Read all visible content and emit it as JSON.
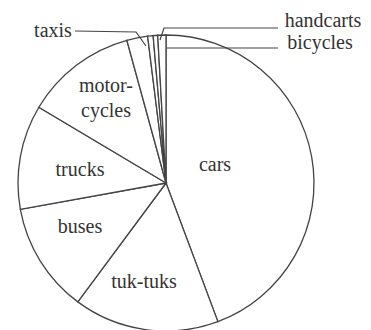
{
  "chart_data": {
    "type": "pie",
    "title": "",
    "start_angle_deg": 0,
    "direction": "clockwise",
    "center": [
      166,
      183
    ],
    "radius": 148,
    "slices": [
      {
        "label": "cars",
        "value": 44.7,
        "label_lines": [
          "cars"
        ],
        "label_pos": [
          215,
          171
        ]
      },
      {
        "label": "tuk-tuks",
        "value": 16.0,
        "label_lines": [
          "tuk-tuks"
        ],
        "label_pos": [
          144,
          288
        ]
      },
      {
        "label": "buses",
        "value": 12.1,
        "label_lines": [
          "buses"
        ],
        "label_pos": [
          80,
          233
        ]
      },
      {
        "label": "trucks",
        "value": 11.5,
        "label_lines": [
          "trucks"
        ],
        "label_pos": [
          80,
          176
        ]
      },
      {
        "label": "motorcycles",
        "value": 12.3,
        "label_lines": [
          "motor-",
          "cycles"
        ],
        "label_pos": [
          106,
          92
        ]
      },
      {
        "label": "taxis",
        "value": 2.3,
        "label_lines": [
          "taxis"
        ],
        "label_pos": [
          53,
          37
        ],
        "external": true
      },
      {
        "label": "",
        "value": 0.6,
        "label_lines": [],
        "label_pos": null
      },
      {
        "label": "handcarts",
        "value": 0.5,
        "label_lines": [
          "handcarts"
        ],
        "label_pos": [
          323,
          27
        ],
        "external": true
      },
      {
        "label": "bicycles",
        "value": 0.9,
        "label_lines": [
          "bicycles"
        ],
        "label_pos": [
          320,
          49
        ],
        "external": true
      }
    ],
    "leaders": [
      {
        "label": "taxis",
        "points": [
          [
            75,
            31
          ],
          [
            136,
            32
          ],
          [
            146,
            46
          ]
        ]
      },
      {
        "label": "handcarts",
        "points": [
          [
            278,
            28
          ],
          [
            164,
            28
          ],
          [
            160,
            40
          ]
        ]
      },
      {
        "label": "bicycles",
        "points": [
          [
            278,
            48
          ],
          [
            166,
            48
          ]
        ]
      }
    ],
    "legend": null,
    "grid": false
  }
}
